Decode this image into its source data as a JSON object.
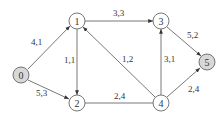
{
  "diagram": {
    "type": "directed-network-flow-graph",
    "colors": {
      "line": "#555555",
      "node_fill": "#ffffff",
      "terminal_fill": "#d8d8d8",
      "text": "#333333"
    },
    "nodes": [
      {
        "id": "0",
        "label": "0",
        "x": 21,
        "y": 75,
        "shaded": true
      },
      {
        "id": "1",
        "label": "1",
        "x": 77,
        "y": 21,
        "shaded": false
      },
      {
        "id": "2",
        "label": "2",
        "x": 77,
        "y": 103,
        "shaded": false
      },
      {
        "id": "3",
        "label": "3",
        "x": 161,
        "y": 21,
        "shaded": false
      },
      {
        "id": "4",
        "label": "4",
        "x": 161,
        "y": 103,
        "shaded": false
      },
      {
        "id": "5",
        "label": "5",
        "x": 207,
        "y": 62,
        "shaded": true
      }
    ],
    "edges": [
      {
        "from": "0",
        "to": "1",
        "label": "4,1",
        "directed": true
      },
      {
        "from": "0",
        "to": "2",
        "label": "5,3",
        "directed": true
      },
      {
        "from": "1",
        "to": "2",
        "label": "1,1",
        "directed": true
      },
      {
        "from": "1",
        "to": "3",
        "label": "3,3",
        "directed": true
      },
      {
        "from": "4",
        "to": "1",
        "label": "1,2",
        "directed": true
      },
      {
        "from": "2",
        "to": "4",
        "label": "2,4",
        "directed": false
      },
      {
        "from": "4",
        "to": "3",
        "label": "3,1",
        "directed": true
      },
      {
        "from": "3",
        "to": "5",
        "label": "5,2",
        "directed": true
      },
      {
        "from": "4",
        "to": "5",
        "label": "2,4",
        "directed": true
      }
    ]
  }
}
